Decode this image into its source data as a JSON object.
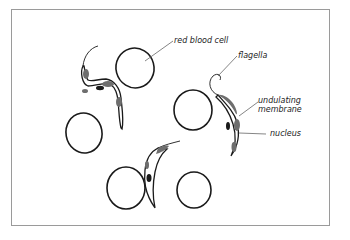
{
  "diagram": {
    "labels": {
      "red_blood_cell": "red blood cell",
      "flagella": "flagella",
      "undulating_membrane_1": "undulating",
      "undulating_membrane_2": "membrane",
      "nucleus": "nucleus"
    },
    "colors": {
      "outline": "#1a1a1a",
      "membrane_shading": "#6e6e6e",
      "leader_line": "#777777",
      "frame": "#9a9a9a"
    }
  }
}
